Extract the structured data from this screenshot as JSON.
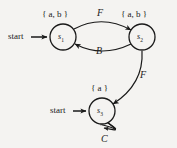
{
  "diagram": {
    "background_color": "#f4f3f1",
    "stroke_color": "#1a1a1a",
    "states": [
      {
        "id": "s1",
        "name": "s",
        "subscript": "1",
        "set_label": "{ a, b }",
        "set_items": "a, b",
        "cx": 63,
        "cy": 37,
        "r": 13,
        "has_start_arrow": true,
        "start_label": "start"
      },
      {
        "id": "s2",
        "name": "s",
        "subscript": "2",
        "set_label": "{ a, b }",
        "set_items": "a, b",
        "cx": 142,
        "cy": 37,
        "r": 13,
        "has_start_arrow": false,
        "start_label": ""
      },
      {
        "id": "s3",
        "name": "s",
        "subscript": "3",
        "set_label": "{ a }",
        "set_items": "a",
        "cx": 102,
        "cy": 111,
        "r": 13,
        "has_start_arrow": true,
        "start_label": "start"
      }
    ],
    "transitions": [
      {
        "id": "t1",
        "from": "s1",
        "to": "s2",
        "label": "F",
        "shape": "arc-top"
      },
      {
        "id": "t2",
        "from": "s2",
        "to": "s1",
        "label": "B",
        "shape": "arc-bottom"
      },
      {
        "id": "t3",
        "from": "s2",
        "to": "s3",
        "label": "F",
        "shape": "curve-diagonal"
      },
      {
        "id": "t4",
        "from": "s3",
        "to": "s3",
        "label": "C",
        "shape": "self-loop"
      }
    ],
    "start_labels": [
      {
        "id": "start-s1",
        "text": "start",
        "x": 8,
        "y": 32
      },
      {
        "id": "start-s3",
        "text": "start",
        "x": 50,
        "y": 106
      }
    ],
    "edge_label_positions": [
      {
        "id": "label-F-top",
        "text": "F",
        "x": 97,
        "y": 8
      },
      {
        "id": "label-B-bottom",
        "text": "B",
        "x": 96,
        "y": 46
      },
      {
        "id": "label-F-diagonal",
        "text": "F",
        "x": 140,
        "y": 70
      },
      {
        "id": "label-C-loop",
        "text": "C",
        "x": 101,
        "y": 134
      }
    ]
  }
}
